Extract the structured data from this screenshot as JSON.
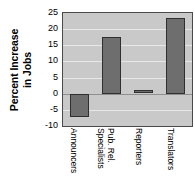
{
  "chart_data": {
    "type": "bar",
    "title": "",
    "xlabel": "",
    "ylabel": "Percent Increase in Jobs",
    "ylabel_lines": [
      "Percent Increase",
      "in Jobs"
    ],
    "categories": [
      "Announcers",
      "Pub. Rel. Specialists",
      "Reporters",
      "Translators"
    ],
    "category_lines": [
      [
        "Announcers"
      ],
      [
        "Pub. Rel.",
        "Specialists"
      ],
      [
        "Reporters"
      ],
      [
        "Translators"
      ]
    ],
    "values": [
      -7,
      17.5,
      1,
      23.5
    ],
    "ylim": [
      -10,
      25
    ],
    "yticks": [
      25,
      20,
      15,
      10,
      5,
      0,
      -5,
      -10
    ],
    "ytick_labels": [
      "25",
      "20",
      "15",
      "10",
      "5",
      "0",
      "-5",
      "-10"
    ],
    "grid": true,
    "legend": "none",
    "colors": {
      "bar_fill": "#6e6e6e",
      "bar_outline": "#2f2f2f",
      "plot_background": "#c9c9c9",
      "gridline": "#e8e8e8",
      "zero_line": "#8f8f8f",
      "axis_border": "#4a4a4a",
      "text": "#000000",
      "page_background": "#ffffff"
    }
  }
}
